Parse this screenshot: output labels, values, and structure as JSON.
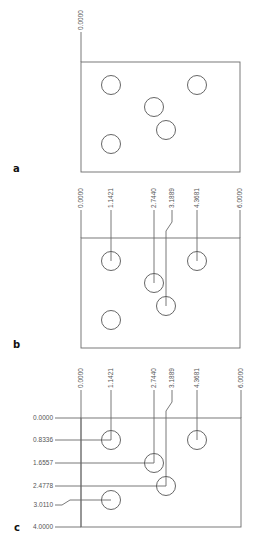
{
  "panels": [
    {
      "label": "a",
      "x_dims": [
        "0.0000"
      ],
      "y_dims": []
    },
    {
      "label": "b",
      "x_dims": [
        "0.0000",
        "1.1421",
        "2.7440",
        "3.1889",
        "4.3681",
        "6.0000"
      ],
      "y_dims": []
    },
    {
      "label": "c",
      "x_dims": [
        "0.0000",
        "1.1421",
        "2.7440",
        "3.1889",
        "4.3681",
        "6.0000"
      ],
      "y_dims": [
        "0.0000",
        "0.8336",
        "1.6557",
        "2.4778",
        "3.0110",
        "4.0000"
      ]
    }
  ],
  "holes": [
    {
      "x": 1.1421,
      "y": 0.8336
    },
    {
      "x": 4.3681,
      "y": 0.8336
    },
    {
      "x": 2.744,
      "y": 1.6557
    },
    {
      "x": 3.1889,
      "y": 2.4778
    },
    {
      "x": 1.1421,
      "y": 3.011
    }
  ],
  "plate": {
    "width": "6.0000",
    "height": "4.0000"
  },
  "colors": {
    "line": "#6a6a6a",
    "label": "#111111",
    "text": "#555555"
  }
}
